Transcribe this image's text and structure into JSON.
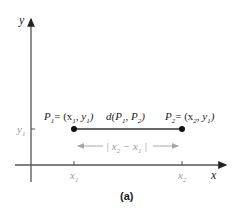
{
  "figure": {
    "caption": "(a)",
    "axes": {
      "x_label": "x",
      "y_label": "y"
    },
    "ticks": {
      "y1": "y",
      "y1_sub": "1",
      "x1": "x",
      "x1_sub": "1",
      "x2": "x",
      "x2_sub": "2"
    },
    "points": {
      "p1": {
        "name": "P",
        "sub": "1",
        "coords": "= (x",
        "c1sub": "1",
        "mid": ", y",
        "c2sub": "1",
        "end": ")"
      },
      "p2": {
        "name": "P",
        "sub": "2",
        "coords": "= (x",
        "c1sub": "2",
        "mid": ", y",
        "c2sub": "1",
        "end": ")"
      }
    },
    "distance_label": {
      "a": "d(P",
      "s1": "1",
      "b": ", P",
      "s2": "2",
      "c": ")"
    },
    "difference_label": {
      "a": "| x",
      "s1": "2",
      "b": " − x",
      "s2": "1",
      "c": " |"
    },
    "colors": {
      "axis": "#333333",
      "segment": "#555555",
      "gray_text": "#999999",
      "point": "#111111"
    }
  }
}
